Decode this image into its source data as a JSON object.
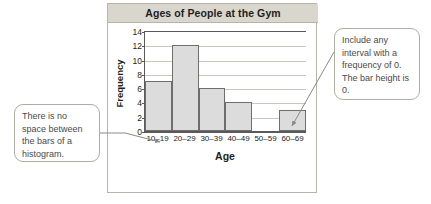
{
  "chart": {
    "title": "Ages of People at the Gym",
    "xlabel": "Age",
    "ylabel": "Frequency"
  },
  "chart_data": {
    "type": "bar",
    "title": "Ages of People at the Gym",
    "xlabel": "Age",
    "ylabel": "Frequency",
    "categories": [
      "10–19",
      "20–29",
      "30–39",
      "40–49",
      "50–59",
      "60–69"
    ],
    "values": [
      7,
      12,
      6,
      4,
      0,
      3
    ],
    "yticks": [
      0,
      2,
      4,
      6,
      8,
      10,
      12,
      14
    ],
    "ylim": [
      0,
      14
    ],
    "grid": true,
    "legend": "none",
    "bar_gap": 0,
    "bar_fill": "#dcdcdc",
    "bar_stroke": "#6e6e6e"
  },
  "annotations": {
    "left": "There is no space between the bars of a histogram.",
    "right": "Include any interval with a frequency of 0. The bar height is 0."
  }
}
